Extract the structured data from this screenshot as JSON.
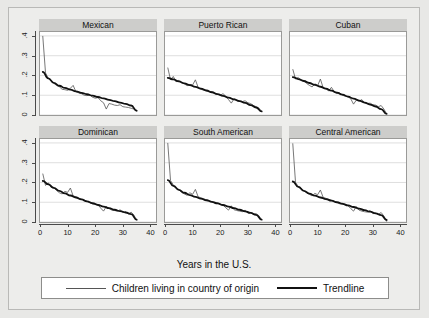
{
  "chart_data": {
    "type": "line",
    "title": "",
    "xlabel": "Years in the U.S.",
    "ylabel": "",
    "xlim": [
      0,
      42
    ],
    "ylim": [
      0,
      0.42
    ],
    "xticks": [
      0,
      10,
      20,
      30,
      40
    ],
    "xtick_labels": [
      "0",
      "10",
      "20",
      "30",
      "40"
    ],
    "yticks": [
      0,
      0.1,
      0.2,
      0.3,
      0.4
    ],
    "ytick_labels": [
      "0",
      ".1",
      ".2",
      ".3",
      ".4"
    ],
    "grid": "horizontal",
    "legend_position": "bottom",
    "legend": [
      {
        "name": "Children living in country of origin",
        "style": "thin"
      },
      {
        "name": "Trendline",
        "style": "thick"
      }
    ],
    "panels": [
      {
        "title": "Mexican",
        "row": 0,
        "col": 0,
        "series": [
          {
            "name": "Children living in country of origin",
            "x": [
              1,
              2,
              3,
              4,
              5,
              6,
              7,
              8,
              9,
              10,
              11,
              12,
              13,
              14,
              15,
              16,
              17,
              18,
              19,
              20,
              21,
              22,
              23,
              24,
              25,
              26,
              27,
              28,
              29,
              30,
              31,
              32,
              33,
              34,
              35
            ],
            "values": [
              0.4,
              0.213,
              0.185,
              0.178,
              0.16,
              0.15,
              0.143,
              0.13,
              0.128,
              0.125,
              0.135,
              0.15,
              0.118,
              0.112,
              0.108,
              0.1,
              0.098,
              0.102,
              0.09,
              0.085,
              0.088,
              0.072,
              0.062,
              0.03,
              0.058,
              0.055,
              0.05,
              0.048,
              0.052,
              0.042,
              0.04,
              0.038,
              0.034,
              0.03,
              0.018
            ]
          },
          {
            "name": "Trendline",
            "x": [
              1,
              3,
              5,
              7,
              9,
              11,
              13,
              15,
              17,
              19,
              21,
              23,
              25,
              27,
              29,
              31,
              33,
              35
            ],
            "values": [
              0.218,
              0.185,
              0.163,
              0.148,
              0.137,
              0.128,
              0.12,
              0.112,
              0.105,
              0.098,
              0.091,
              0.084,
              0.077,
              0.07,
              0.063,
              0.056,
              0.048,
              0.022
            ]
          }
        ]
      },
      {
        "title": "Puerto Rican",
        "row": 0,
        "col": 1,
        "series": [
          {
            "name": "Children living in country of origin",
            "x": [
              1,
              2,
              3,
              4,
              5,
              6,
              7,
              8,
              9,
              10,
              11,
              12,
              13,
              14,
              15,
              16,
              17,
              18,
              19,
              20,
              21,
              22,
              23,
              24,
              25,
              26,
              27,
              28,
              29,
              30,
              31,
              32,
              33,
              34,
              35
            ],
            "values": [
              0.24,
              0.178,
              0.195,
              0.168,
              0.175,
              0.162,
              0.158,
              0.148,
              0.155,
              0.152,
              0.178,
              0.14,
              0.13,
              0.125,
              0.122,
              0.12,
              0.118,
              0.108,
              0.105,
              0.1,
              0.108,
              0.095,
              0.078,
              0.06,
              0.082,
              0.072,
              0.07,
              0.068,
              0.072,
              0.062,
              0.058,
              0.048,
              0.042,
              0.035,
              0.018
            ]
          },
          {
            "name": "Trendline",
            "x": [
              1,
              3,
              5,
              7,
              9,
              11,
              13,
              15,
              17,
              19,
              21,
              23,
              25,
              27,
              29,
              31,
              33,
              35
            ],
            "values": [
              0.188,
              0.18,
              0.17,
              0.16,
              0.151,
              0.142,
              0.133,
              0.124,
              0.115,
              0.106,
              0.097,
              0.088,
              0.079,
              0.07,
              0.061,
              0.05,
              0.038,
              0.018
            ]
          }
        ]
      },
      {
        "title": "Cuban",
        "row": 0,
        "col": 2,
        "series": [
          {
            "name": "Children living in country of origin",
            "x": [
              1,
              2,
              3,
              4,
              5,
              6,
              7,
              8,
              9,
              10,
              11,
              12,
              13,
              14,
              15,
              16,
              17,
              18,
              19,
              20,
              21,
              22,
              23,
              24,
              25,
              26,
              27,
              28,
              29,
              30,
              31,
              32,
              33,
              34,
              35
            ],
            "values": [
              0.232,
              0.182,
              0.19,
              0.175,
              0.172,
              0.16,
              0.15,
              0.142,
              0.158,
              0.148,
              0.182,
              0.138,
              0.132,
              0.122,
              0.14,
              0.118,
              0.108,
              0.112,
              0.1,
              0.095,
              0.092,
              0.082,
              0.055,
              0.075,
              0.07,
              0.078,
              0.062,
              0.058,
              0.06,
              0.052,
              0.05,
              0.042,
              0.048,
              0.03,
              0.005
            ]
          },
          {
            "name": "Trendline",
            "x": [
              1,
              3,
              5,
              7,
              9,
              11,
              13,
              15,
              17,
              19,
              21,
              23,
              25,
              27,
              29,
              31,
              33,
              35
            ],
            "values": [
              0.192,
              0.182,
              0.172,
              0.162,
              0.152,
              0.143,
              0.133,
              0.123,
              0.113,
              0.103,
              0.093,
              0.083,
              0.073,
              0.063,
              0.053,
              0.043,
              0.03,
              0.006
            ]
          }
        ]
      },
      {
        "title": "Dominican",
        "row": 1,
        "col": 0,
        "series": [
          {
            "name": "Children living in country of origin",
            "x": [
              1,
              2,
              3,
              4,
              5,
              6,
              7,
              8,
              9,
              10,
              11,
              12,
              13,
              14,
              15,
              16,
              17,
              18,
              19,
              20,
              21,
              22,
              23,
              24,
              25,
              26,
              27,
              28,
              29,
              30,
              31,
              32,
              33,
              34,
              35
            ],
            "values": [
              0.245,
              0.185,
              0.198,
              0.175,
              0.172,
              0.16,
              0.148,
              0.142,
              0.155,
              0.15,
              0.172,
              0.132,
              0.128,
              0.12,
              0.115,
              0.112,
              0.105,
              0.098,
              0.092,
              0.09,
              0.088,
              0.07,
              0.055,
              0.078,
              0.068,
              0.06,
              0.058,
              0.055,
              0.062,
              0.048,
              0.052,
              0.04,
              0.05,
              0.035,
              0.008
            ]
          },
          {
            "name": "Trendline",
            "x": [
              1,
              3,
              5,
              7,
              9,
              11,
              13,
              15,
              17,
              19,
              21,
              23,
              25,
              27,
              29,
              31,
              33,
              35
            ],
            "values": [
              0.208,
              0.19,
              0.173,
              0.158,
              0.145,
              0.134,
              0.124,
              0.114,
              0.104,
              0.095,
              0.086,
              0.078,
              0.07,
              0.062,
              0.055,
              0.048,
              0.04,
              0.012
            ]
          }
        ]
      },
      {
        "title": "South American",
        "row": 1,
        "col": 1,
        "series": [
          {
            "name": "Children living in country of origin",
            "x": [
              1,
              2,
              3,
              4,
              5,
              6,
              7,
              8,
              9,
              10,
              11,
              12,
              13,
              14,
              15,
              16,
              17,
              18,
              19,
              20,
              21,
              22,
              23,
              24,
              25,
              26,
              27,
              28,
              29,
              30,
              31,
              32,
              33,
              34,
              35
            ],
            "values": [
              0.4,
              0.21,
              0.188,
              0.17,
              0.165,
              0.15,
              0.142,
              0.135,
              0.148,
              0.14,
              0.165,
              0.128,
              0.122,
              0.118,
              0.112,
              0.108,
              0.102,
              0.095,
              0.098,
              0.09,
              0.086,
              0.072,
              0.06,
              0.082,
              0.062,
              0.058,
              0.055,
              0.052,
              0.06,
              0.045,
              0.048,
              0.04,
              0.042,
              0.032,
              0.01
            ]
          },
          {
            "name": "Trendline",
            "x": [
              1,
              3,
              5,
              7,
              9,
              11,
              13,
              15,
              17,
              19,
              21,
              23,
              25,
              27,
              29,
              31,
              33,
              35
            ],
            "values": [
              0.212,
              0.183,
              0.163,
              0.148,
              0.136,
              0.127,
              0.118,
              0.11,
              0.102,
              0.094,
              0.086,
              0.078,
              0.07,
              0.062,
              0.054,
              0.046,
              0.036,
              0.012
            ]
          }
        ]
      },
      {
        "title": "Central American",
        "row": 1,
        "col": 2,
        "series": [
          {
            "name": "Children living in country of origin",
            "x": [
              1,
              2,
              3,
              4,
              5,
              6,
              7,
              8,
              9,
              10,
              11,
              12,
              13,
              14,
              15,
              16,
              17,
              18,
              19,
              20,
              21,
              22,
              23,
              24,
              25,
              26,
              27,
              28,
              29,
              30,
              31,
              32,
              33,
              34,
              35
            ],
            "values": [
              0.398,
              0.2,
              0.18,
              0.172,
              0.158,
              0.148,
              0.14,
              0.132,
              0.145,
              0.138,
              0.162,
              0.125,
              0.12,
              0.115,
              0.11,
              0.105,
              0.1,
              0.092,
              0.095,
              0.088,
              0.082,
              0.068,
              0.055,
              0.078,
              0.06,
              0.055,
              0.052,
              0.05,
              0.058,
              0.042,
              0.045,
              0.038,
              0.048,
              0.03,
              0.002
            ]
          },
          {
            "name": "Trendline",
            "x": [
              1,
              3,
              5,
              7,
              9,
              11,
              13,
              15,
              17,
              19,
              21,
              23,
              25,
              27,
              29,
              31,
              33,
              35
            ],
            "values": [
              0.205,
              0.178,
              0.158,
              0.144,
              0.133,
              0.124,
              0.116,
              0.108,
              0.1,
              0.092,
              0.084,
              0.076,
              0.068,
              0.06,
              0.052,
              0.044,
              0.035,
              0.01
            ]
          }
        ]
      }
    ],
    "colors": {
      "data_line": "#555555",
      "trend_line": "#111111",
      "panel_header": "#cdcdcb",
      "figure_background": "#ededeb",
      "plot_background": "#ffffff",
      "gridline": "#d6d6d6",
      "axis": "#4a4a4a"
    }
  }
}
